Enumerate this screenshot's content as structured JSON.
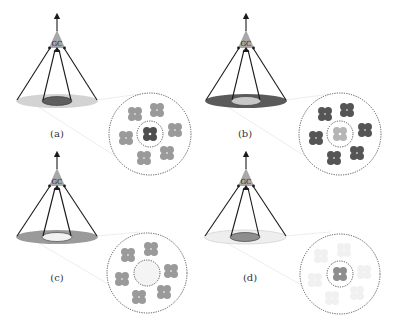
{
  "figure": {
    "type": "receptive-field-diagram",
    "node_label": "GC",
    "colors": {
      "dark": "#5a5a5a",
      "mid": "#9a9a9a",
      "light": "#d9d9d9",
      "very_light": "#eeeeee",
      "line": "#1a1a1a",
      "dashed": "#444444",
      "triangle": "#a8a8a8"
    },
    "panels": [
      {
        "id": "a",
        "label": "(a)",
        "apex": [
          57,
          12
        ],
        "ellipse_center": [
          57,
          100
        ],
        "outer_fill": "light",
        "inner_fill": "dark",
        "label_pos": [
          57,
          136
        ],
        "zoom_center": [
          150,
          134
        ],
        "cluster_outer_fill": "mid",
        "cluster_inner_fill": "dark"
      },
      {
        "id": "b",
        "label": "(b)",
        "apex": [
          246,
          12
        ],
        "ellipse_center": [
          246,
          100
        ],
        "outer_fill": "dark",
        "inner_fill": "light",
        "label_pos": [
          245,
          136
        ],
        "zoom_center": [
          340,
          134
        ],
        "cluster_outer_fill": "dark",
        "cluster_inner_fill": "mid_light"
      },
      {
        "id": "c",
        "label": "(c)",
        "apex": [
          57,
          160
        ],
        "ellipse_center": [
          57,
          236
        ],
        "outer_fill": "mid",
        "inner_fill": "very_light",
        "label_pos": [
          57,
          280
        ],
        "zoom_center": [
          147,
          273
        ],
        "cluster_outer_fill": "mid",
        "cluster_inner_fill": "none"
      },
      {
        "id": "d",
        "label": "(d)",
        "apex": [
          246,
          160
        ],
        "ellipse_center": [
          245,
          236
        ],
        "outer_fill": "very_light",
        "inner_fill": "mid",
        "label_pos": [
          250,
          280
        ],
        "zoom_center": [
          340,
          274
        ],
        "cluster_outer_fill": "faint",
        "cluster_inner_fill": "mid"
      }
    ]
  }
}
